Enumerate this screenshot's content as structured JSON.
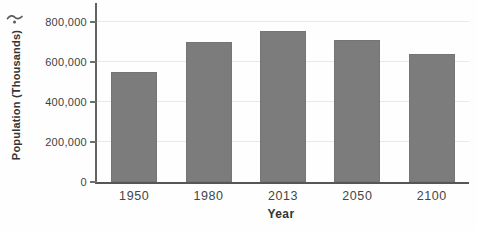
{
  "chart_data": {
    "type": "bar",
    "title": "",
    "xlabel": "Year",
    "ylabel": "Population (Thousands)",
    "categories": [
      "1950",
      "1980",
      "2013",
      "2050",
      "2100"
    ],
    "values": [
      550000,
      700000,
      755000,
      710000,
      640000
    ],
    "ylim": [
      0,
      800000
    ],
    "yticks": [
      {
        "value": 0,
        "label": "0"
      },
      {
        "value": 200000,
        "label": "200,000"
      },
      {
        "value": 400000,
        "label": "400,000"
      },
      {
        "value": 600000,
        "label": "600,000"
      },
      {
        "value": 800000,
        "label": "800,000"
      }
    ],
    "grid": "horizontal",
    "legend": "none",
    "bar_color": "#7c7c7c",
    "gridline_color": "#e8e8e8",
    "axis_color": "#5f5f5f",
    "text_color": "#413f3f"
  }
}
